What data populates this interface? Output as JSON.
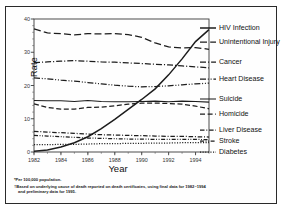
{
  "axes": {
    "ylabel": "Rate",
    "xlabel": "Year",
    "yticks": [
      "0",
      "10",
      "20",
      "30",
      "40"
    ],
    "xticks": [
      "1982",
      "1984",
      "1986",
      "1988",
      "1990",
      "1992",
      "1994"
    ]
  },
  "legend": [
    {
      "label": "HIV Infection"
    },
    {
      "label": "Unintentional Injury"
    },
    {
      "label": "Cancer"
    },
    {
      "label": "Heart Disease"
    },
    {
      "label": "Suicide"
    },
    {
      "label": "Homicide"
    },
    {
      "label": "Liver Disease"
    },
    {
      "label": "Stroke"
    },
    {
      "label": "Diabetes"
    }
  ],
  "footnotes": {
    "line1": "*Per 100,000 population.",
    "line2a": "†Based on underlying cause of death reported on death certificates, using final data for 1982–1994",
    "line2b": "and preliminary data for 1995."
  },
  "chart_data": {
    "type": "line",
    "title": "",
    "xlabel": "Year",
    "ylabel": "Rate",
    "xlim": [
      1982,
      1995
    ],
    "ylim": [
      0,
      40
    ],
    "grid": false,
    "legend_position": "right",
    "x": [
      1982,
      1983,
      1984,
      1985,
      1986,
      1987,
      1988,
      1989,
      1990,
      1991,
      1992,
      1993,
      1994,
      1995
    ],
    "series": [
      {
        "name": "HIV Infection",
        "style": "solid",
        "values": [
          0.2,
          0.6,
          1.5,
          2.8,
          4.6,
          7.0,
          9.8,
          12.8,
          15.8,
          19.0,
          23.2,
          28.0,
          33.2,
          36.8
        ]
      },
      {
        "name": "Unintentional Injury",
        "style": "dashed",
        "values": [
          37.0,
          35.8,
          35.6,
          35.2,
          35.6,
          35.5,
          35.6,
          35.3,
          34.5,
          32.8,
          31.6,
          31.3,
          31.4,
          30.9
        ]
      },
      {
        "name": "Cancer",
        "style": "dash-dot",
        "values": [
          26.9,
          27.1,
          27.3,
          27.5,
          27.3,
          27.1,
          27.0,
          26.8,
          26.6,
          26.4,
          26.2,
          25.9,
          25.6,
          25.3
        ]
      },
      {
        "name": "Heart Disease",
        "style": "dash-dot-dot",
        "values": [
          22.3,
          22.0,
          21.6,
          21.3,
          20.9,
          20.5,
          20.1,
          19.8,
          19.6,
          19.7,
          19.9,
          20.2,
          20.5,
          20.7
        ]
      },
      {
        "name": "Suicide",
        "style": "solid-thin",
        "values": [
          15.5,
          15.4,
          15.4,
          15.2,
          15.5,
          15.2,
          15.1,
          15.1,
          15.2,
          15.3,
          15.1,
          15.3,
          15.2,
          15.0
        ]
      },
      {
        "name": "Homicide",
        "style": "dashed-short",
        "values": [
          14.5,
          13.4,
          12.9,
          12.9,
          13.4,
          13.5,
          13.9,
          14.4,
          14.7,
          14.7,
          14.6,
          14.4,
          13.8,
          13.0
        ]
      },
      {
        "name": "Liver Disease",
        "style": "dash-dot-short",
        "values": [
          6.2,
          6.0,
          5.8,
          5.6,
          5.4,
          5.2,
          5.1,
          5.0,
          4.9,
          4.8,
          4.7,
          4.7,
          4.6,
          4.5
        ]
      },
      {
        "name": "Stroke",
        "style": "dash-dot-dot-short",
        "values": [
          5.0,
          4.8,
          4.6,
          4.4,
          4.2,
          4.1,
          4.0,
          3.9,
          3.9,
          3.8,
          3.8,
          3.8,
          3.8,
          3.7
        ]
      },
      {
        "name": "Diabetes",
        "style": "dotted",
        "values": [
          2.2,
          2.2,
          2.3,
          2.3,
          2.4,
          2.5,
          2.5,
          2.6,
          2.6,
          2.7,
          2.7,
          2.8,
          2.8,
          2.8
        ]
      }
    ]
  }
}
